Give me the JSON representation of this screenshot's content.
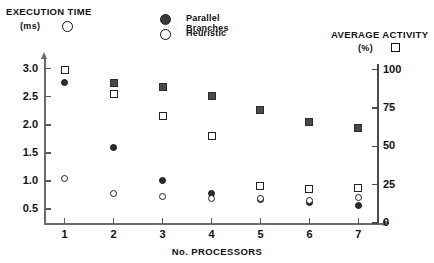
{
  "chart_data": {
    "type": "scatter",
    "title": "",
    "xlabel": "No. PROCESSORS",
    "ylabel": "EXECUTION TIME (ms)",
    "y2label": "AVERAGE ACTIVITY (%)",
    "x": [
      1,
      2,
      3,
      4,
      5,
      6,
      7
    ],
    "xlim": [
      0.6,
      7.4
    ],
    "ylim": [
      0.25,
      3.12
    ],
    "y2lim": [
      0,
      105
    ],
    "grid": false,
    "legend_position": "top-center",
    "yticks": [
      0.5,
      1.0,
      1.5,
      2.0,
      2.5,
      3.0
    ],
    "ytick_labels": [
      "0.5",
      "1.0",
      "1.5",
      "2.0",
      "2.5",
      "3.0"
    ],
    "y2ticks": [
      0,
      25,
      50,
      75,
      100
    ],
    "y2tick_labels": [
      "0",
      "25",
      "50",
      "75",
      "100"
    ],
    "xtick_labels": [
      "1",
      "2",
      "3",
      "4",
      "5",
      "6",
      "7"
    ],
    "series": [
      {
        "name": "Parallel Branches",
        "marker": "filled-circle",
        "axis": "left",
        "values": [
          2.75,
          1.6,
          1.0,
          0.78,
          0.67,
          0.61,
          0.57
        ]
      },
      {
        "name": "Heuristic",
        "marker": "open-circle",
        "axis": "left",
        "values": [
          1.05,
          0.78,
          0.72,
          0.68,
          0.68,
          0.66,
          0.7
        ]
      },
      {
        "name": "Parallel Branches Activity",
        "marker": "filled-square",
        "axis": "right",
        "values": [
          100,
          91,
          89,
          83,
          74,
          66,
          62
        ]
      },
      {
        "name": "Heuristic Activity",
        "marker": "open-square",
        "axis": "right",
        "values": [
          100,
          84,
          70,
          57,
          24,
          22,
          23
        ]
      }
    ]
  },
  "left_axis": {
    "title": "EXECUTION TIME",
    "units": "(ms)",
    "marker_name": "open-circle-marker"
  },
  "right_axis": {
    "title": "AVERAGE ACTIVITY",
    "units": "(%)",
    "marker_name": "open-square-marker"
  },
  "legend": {
    "items": [
      {
        "label": "Parallel Branches",
        "marker": "filled-circle"
      },
      {
        "label": "Heuristic",
        "marker": "open-circle"
      }
    ]
  },
  "x_axis": {
    "name": "No. PROCESSORS"
  },
  "colors": {
    "filled_marker": "#2b2b2b",
    "square_fill": "#4a4a4a",
    "axis": "#6b6b6b",
    "text": "#111111",
    "background": "#ffffff"
  }
}
